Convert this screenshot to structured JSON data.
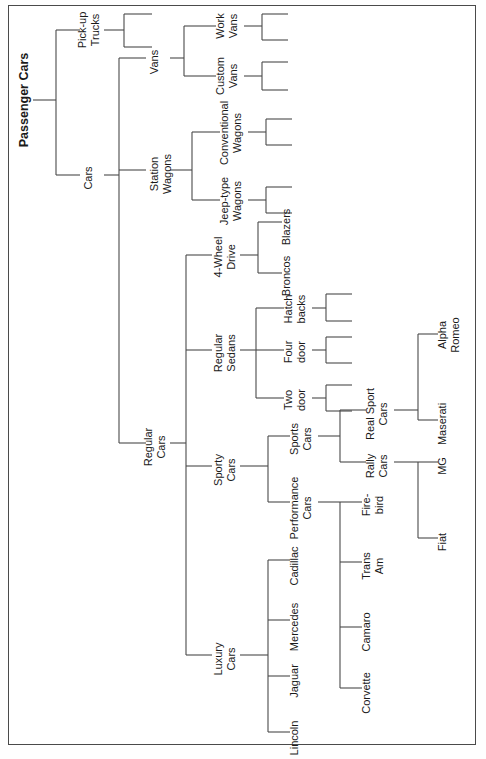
{
  "diagram": {
    "title": "Passenger Cars",
    "orientation": "rotated-90-ccw",
    "root": "Passenger Cars",
    "nodes": {
      "root": "Passenger Cars",
      "pickup_trucks": "Pick-up\nTrucks",
      "pickup_trucks_l1": "Pick-up",
      "pickup_trucks_l2": "Trucks",
      "cars": "Cars",
      "vans": "Vans",
      "custom_vans_l1": "Custom",
      "custom_vans_l2": "Vans",
      "work_vans_l1": "Work",
      "work_vans_l2": "Vans",
      "station_wagons_l1": "Station",
      "station_wagons_l2": "Wagons",
      "conventional_wagons_l1": "Conventional",
      "conventional_wagons_l2": "Wagons",
      "jeep_wagons_l1": "Jeep-type",
      "jeep_wagons_l2": "Wagons",
      "regular_cars_l1": "Regular",
      "regular_cars_l2": "Cars",
      "four_wheel_drive_l1": "4-Wheel",
      "four_wheel_drive_l2": "Drive",
      "blazers": "Blazers",
      "broncos": "Broncos",
      "regular_sedans_l1": "Regular",
      "regular_sedans_l2": "Sedans",
      "hatchbacks_l1": "Hatch",
      "hatchbacks_l2": "backs",
      "four_door_l1": "Four",
      "four_door_l2": "door",
      "two_door_l1": "Two",
      "two_door_l2": "door",
      "sporty_cars_l1": "Sporty",
      "sporty_cars_l2": "Cars",
      "sports_cars_l1": "Sports",
      "sports_cars_l2": "Cars",
      "real_sport_cars_l1": "Real Sport",
      "real_sport_cars_l2": "Cars",
      "alpha_romeo_l1": "Alpha",
      "alpha_romeo_l2": "Romeo",
      "maserati": "Maserati",
      "rally_cars_l1": "Rally",
      "rally_cars_l2": "Cars",
      "mg": "MG",
      "fiat": "Fiat",
      "performance_cars_l1": "Performance",
      "performance_cars_l2": "Cars",
      "firebird_l1": "Fire-",
      "firebird_l2": "bird",
      "trans_am_l1": "Trans",
      "trans_am_l2": "Am",
      "camaro": "Camaro",
      "corvette": "Corvette",
      "luxury_cars_l1": "Luxury",
      "luxury_cars_l2": "Cars",
      "cadillac": "Cadillac",
      "mercedes": "Mercedes",
      "jaguar": "Jaguar",
      "lincoln": "Lincoln"
    },
    "hierarchy": {
      "label": "Passenger Cars",
      "children": [
        {
          "label": "Pick-up Trucks",
          "children": [
            {
              "label": ""
            },
            {
              "label": ""
            }
          ]
        },
        {
          "label": "Cars",
          "children": [
            {
              "label": "Vans",
              "children": [
                {
                  "label": "Custom Vans",
                  "children": [
                    {
                      "label": ""
                    },
                    {
                      "label": ""
                    }
                  ]
                },
                {
                  "label": "Work Vans",
                  "children": [
                    {
                      "label": ""
                    },
                    {
                      "label": ""
                    }
                  ]
                }
              ]
            },
            {
              "label": "Station Wagons",
              "children": [
                {
                  "label": "Conventional Wagons",
                  "children": [
                    {
                      "label": ""
                    },
                    {
                      "label": ""
                    }
                  ]
                },
                {
                  "label": "Jeep-type Wagons",
                  "children": [
                    {
                      "label": ""
                    },
                    {
                      "label": ""
                    }
                  ]
                }
              ]
            },
            {
              "label": "Regular Cars",
              "children": [
                {
                  "label": "4-Wheel Drive",
                  "children": [
                    {
                      "label": "Blazers"
                    },
                    {
                      "label": "Broncos"
                    }
                  ]
                },
                {
                  "label": "Regular Sedans",
                  "children": [
                    {
                      "label": "Hatch backs",
                      "children": [
                        {
                          "label": ""
                        },
                        {
                          "label": ""
                        }
                      ]
                    },
                    {
                      "label": "Four door",
                      "children": [
                        {
                          "label": ""
                        },
                        {
                          "label": ""
                        }
                      ]
                    },
                    {
                      "label": "Two door",
                      "children": [
                        {
                          "label": ""
                        },
                        {
                          "label": ""
                        }
                      ]
                    }
                  ]
                },
                {
                  "label": "Sporty Cars",
                  "children": [
                    {
                      "label": "Sports Cars",
                      "children": [
                        {
                          "label": "Real Sport Cars",
                          "children": [
                            {
                              "label": "Alpha Romeo"
                            },
                            {
                              "label": "Maserati"
                            }
                          ]
                        },
                        {
                          "label": "Rally Cars",
                          "children": [
                            {
                              "label": "MG"
                            },
                            {
                              "label": "Fiat"
                            }
                          ]
                        }
                      ]
                    },
                    {
                      "label": "Performance Cars",
                      "children": [
                        {
                          "label": "Fire-bird"
                        },
                        {
                          "label": "Trans Am"
                        },
                        {
                          "label": "Camaro"
                        },
                        {
                          "label": "Corvette"
                        }
                      ]
                    }
                  ]
                },
                {
                  "label": "Luxury Cars",
                  "children": [
                    {
                      "label": "Cadillac"
                    },
                    {
                      "label": "Mercedes"
                    },
                    {
                      "label": "Jaguar"
                    },
                    {
                      "label": "Lincoln"
                    }
                  ]
                }
              ]
            }
          ]
        }
      ]
    },
    "colors": {
      "line": "#4a4a4a",
      "text": "#1a1a1a",
      "background": "#ffffff",
      "frame": "#4a4a4a"
    }
  }
}
